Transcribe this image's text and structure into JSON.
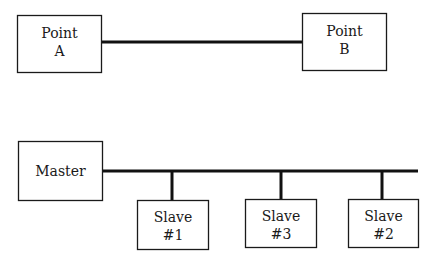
{
  "diagram": {
    "point_to_point": {
      "nodes": [
        {
          "id": "point-a",
          "lines": [
            "Point",
            "A"
          ]
        },
        {
          "id": "point-b",
          "lines": [
            "Point",
            "B"
          ]
        }
      ],
      "connection": {
        "from": "point-a",
        "to": "point-b",
        "type": "direct-link"
      }
    },
    "multidrop": {
      "master": {
        "id": "master",
        "lines": [
          "Master"
        ]
      },
      "slaves": [
        {
          "id": "slave-1",
          "lines": [
            "Slave",
            "#1"
          ]
        },
        {
          "id": "slave-3",
          "lines": [
            "Slave",
            "#3"
          ]
        },
        {
          "id": "slave-2",
          "lines": [
            "Slave",
            "#2"
          ]
        }
      ],
      "connection": {
        "type": "shared-bus"
      }
    }
  }
}
